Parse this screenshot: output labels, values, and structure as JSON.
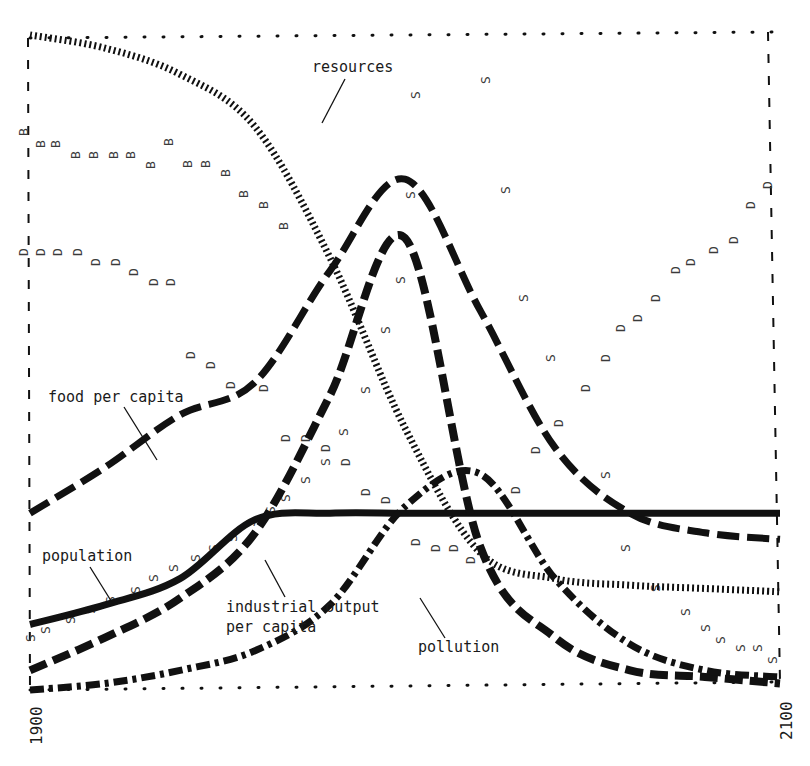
{
  "chart_data": {
    "type": "line",
    "title": "",
    "xlabel": "",
    "ylabel": "",
    "x_ticks": [
      "1900",
      "2100"
    ],
    "xlim": [
      1900,
      2100
    ],
    "ylim": [
      0,
      1
    ],
    "grid": false,
    "legend": "inline annotations",
    "annotations": [
      {
        "text": "resources",
        "series": "resources"
      },
      {
        "text": "food per capita",
        "series": "food per capita"
      },
      {
        "text": "population",
        "series": "population"
      },
      {
        "text": "industrial output per capita",
        "series": "industrial output per capita"
      },
      {
        "text": "pollution",
        "series": "pollution"
      }
    ],
    "x": [
      1900,
      1920,
      1940,
      1960,
      1980,
      2000,
      2020,
      2040,
      2060,
      2080,
      2100
    ],
    "series": [
      {
        "name": "resources",
        "style": "dotted",
        "values": [
          1.0,
          0.98,
          0.94,
          0.86,
          0.66,
          0.4,
          0.21,
          0.17,
          0.16,
          0.155,
          0.15
        ]
      },
      {
        "name": "food per capita",
        "style": "dashed",
        "values": [
          0.27,
          0.34,
          0.42,
          0.47,
          0.64,
          0.78,
          0.58,
          0.37,
          0.27,
          0.24,
          0.23
        ]
      },
      {
        "name": "population",
        "style": "solid",
        "values": [
          0.1,
          0.13,
          0.17,
          0.26,
          0.27,
          0.27,
          0.27,
          0.27,
          0.27,
          0.27,
          0.27
        ]
      },
      {
        "name": "industrial output per capita",
        "style": "long-dash",
        "values": [
          0.03,
          0.08,
          0.14,
          0.24,
          0.45,
          0.69,
          0.22,
          0.08,
          0.03,
          0.02,
          0.01
        ]
      },
      {
        "name": "pollution",
        "style": "dash-dot",
        "values": [
          0.0,
          0.01,
          0.03,
          0.06,
          0.13,
          0.28,
          0.33,
          0.17,
          0.07,
          0.03,
          0.02
        ]
      }
    ],
    "marker_series": [
      {
        "letter": "B",
        "description": "birth rate scatter",
        "trend": "declining from ~0.83 to ~0.71 by 1950"
      },
      {
        "letter": "D",
        "description": "death rate scatter",
        "trend": "declining to ~0.21 near 2000 then rising to ~0.80 by 2100"
      },
      {
        "letter": "S",
        "description": "services per capita scatter",
        "trend": "rising to ~0.87 near 2030 then falling to ~0.03 by 2100"
      }
    ]
  }
}
